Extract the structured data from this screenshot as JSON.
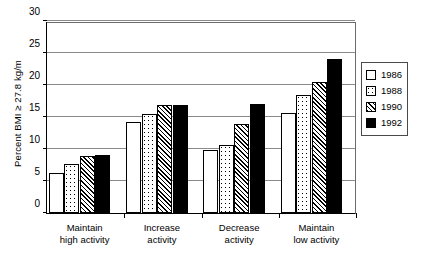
{
  "chart_data": {
    "type": "bar",
    "title": "",
    "xlabel": "",
    "ylabel": "Percent BMI ≥ 27.8 kg/m",
    "ylabel_main": "Percent BMI ≥ 27.8 kg/m",
    "ylabel_sup": "",
    "ylim": [
      0,
      30
    ],
    "yticks": [
      0,
      5,
      10,
      15,
      20,
      25,
      30
    ],
    "ytick_labels": [
      "0",
      "5",
      "10",
      "15",
      "20",
      "25",
      "30"
    ],
    "grid": true,
    "grid_axis": "y",
    "legend_position": "right",
    "categories": [
      "Maintain high activity",
      "Increase activity",
      "Decrease activity",
      "Maintain low activity"
    ],
    "category_lines": [
      [
        "Maintain",
        "high activity"
      ],
      [
        "Increase",
        "activity"
      ],
      [
        "Decrease",
        "activity"
      ],
      [
        "Maintain",
        "low activity"
      ]
    ],
    "series": [
      {
        "name": "1986",
        "pattern": "empty",
        "values": [
          6.3,
          14.2,
          9.8,
          15.7
        ]
      },
      {
        "name": "1988",
        "pattern": "dots",
        "values": [
          7.7,
          15.5,
          10.7,
          18.5
        ]
      },
      {
        "name": "1990",
        "pattern": "hatch",
        "values": [
          8.9,
          16.8,
          13.9,
          20.5
        ]
      },
      {
        "name": "1992",
        "pattern": "solid",
        "values": [
          9.1,
          16.9,
          17.0,
          24.1
        ]
      }
    ]
  },
  "legend": {
    "items": [
      {
        "label": "1986",
        "pattern": "empty"
      },
      {
        "label": "1988",
        "pattern": "dots"
      },
      {
        "label": "1990",
        "pattern": "hatch"
      },
      {
        "label": "1992",
        "pattern": "solid"
      }
    ]
  },
  "colors": {
    "axis": "#000000",
    "gridline": "#8a8a8a",
    "bar_outline": "#000000",
    "bar_fill_light": "#ffffff",
    "bar_fill_dark": "#000000",
    "background": "#ffffff"
  }
}
